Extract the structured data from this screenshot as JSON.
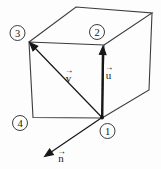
{
  "diagram": {
    "description_label": "cube-with-vectors",
    "background_color": "#fdfdfd",
    "line_color": "#3c3c3c",
    "vector_color": "#161616",
    "vertices": [
      {
        "label": "1"
      },
      {
        "label": "2"
      },
      {
        "label": "3"
      },
      {
        "label": "4"
      }
    ],
    "vectors": [
      {
        "letter": "u",
        "arrow": "→"
      },
      {
        "letter": "v",
        "arrow": "→"
      },
      {
        "letter": "n",
        "arrow": "→"
      }
    ]
  }
}
